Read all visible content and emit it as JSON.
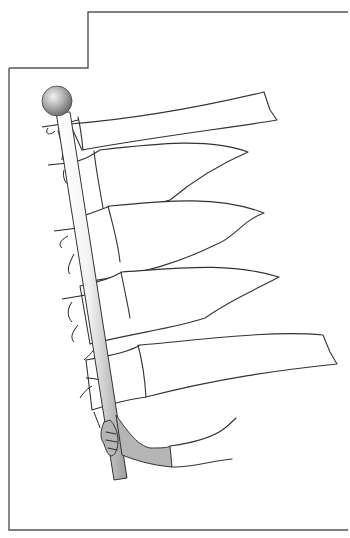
{
  "illustration": {
    "subject": "Five streamer flags tied to a slanted flagpole held by a hand",
    "flag_count": 5,
    "colors": {
      "line": "#333333",
      "frame": "#555555",
      "background": "#ffffff",
      "sleeve_fill": "#b5b5b5",
      "finial_light": "#e6e6e6",
      "finial_dark": "#7a7a7a",
      "pole_light": "#f2f2f2",
      "pole_dark": "#9a9a9a"
    }
  }
}
